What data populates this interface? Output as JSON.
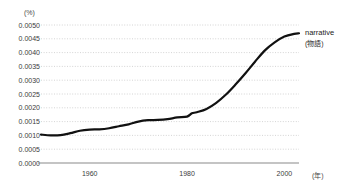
{
  "chart_data": {
    "type": "line",
    "title": "",
    "xlabel": "(年)",
    "ylabel": "(%)",
    "xlim": [
      1950,
      2003
    ],
    "ylim": [
      0.0,
      0.005
    ],
    "grid": true,
    "legend_position": "right-end-of-line",
    "x_ticks": [
      1960,
      1980,
      2000
    ],
    "x_tick_labels": [
      "1960",
      "1980",
      "2000"
    ],
    "y_ticks": [
      0.0,
      0.0005,
      0.001,
      0.0015,
      0.002,
      0.0025,
      0.003,
      0.0035,
      0.004,
      0.0045,
      0.005
    ],
    "y_tick_labels": [
      "0.0000",
      "0.0005",
      "0.0010",
      "0.0015",
      "0.0020",
      "0.0025",
      "0.0030",
      "0.0035",
      "0.0040",
      "0.0045",
      "0.0050"
    ],
    "series": [
      {
        "name": "narrative",
        "name_jp": "(物語)",
        "color": "#111111",
        "x": [
          1950,
          1952,
          1954,
          1956,
          1958,
          1960,
          1962,
          1964,
          1966,
          1968,
          1970,
          1972,
          1974,
          1976,
          1978,
          1980,
          1981,
          1982,
          1984,
          1986,
          1988,
          1990,
          1992,
          1994,
          1996,
          1998,
          2000,
          2002,
          2003
        ],
        "values": [
          0.00103,
          0.001,
          0.00101,
          0.00108,
          0.00117,
          0.00121,
          0.00122,
          0.00126,
          0.00133,
          0.0014,
          0.0015,
          0.00155,
          0.00156,
          0.00159,
          0.00165,
          0.00168,
          0.0018,
          0.00184,
          0.00196,
          0.00218,
          0.00248,
          0.00285,
          0.00325,
          0.00368,
          0.00408,
          0.00437,
          0.00458,
          0.00468,
          0.0047
        ]
      }
    ]
  },
  "legend": {
    "label_en": "narrative",
    "label_jp": "(物語)"
  },
  "axes": {
    "y_unit": "(%)",
    "x_unit": "(年)"
  },
  "colors": {
    "line": "#111111",
    "grid": "#c9c9c9",
    "baseline": "#8a8a8a",
    "text": "#3c3c3c"
  }
}
